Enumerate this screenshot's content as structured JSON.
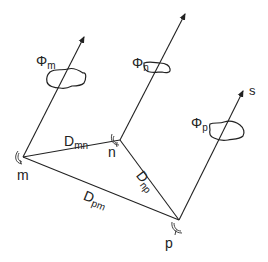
{
  "diagram": {
    "colors": {
      "stroke": "#222222",
      "background": "#ffffff"
    },
    "nodes": [
      {
        "id": "m",
        "label": "m",
        "x": 23,
        "y": 157
      },
      {
        "id": "n",
        "label": "n",
        "x": 120,
        "y": 140
      },
      {
        "id": "p",
        "label": "p",
        "x": 179,
        "y": 220
      }
    ],
    "edges": [
      {
        "from": "m",
        "to": "n",
        "label_main": "D",
        "label_sub": "mn"
      },
      {
        "from": "n",
        "to": "p",
        "label_main": "D",
        "label_sub": "np"
      },
      {
        "from": "p",
        "to": "m",
        "label_main": "D",
        "label_sub": "pm"
      }
    ],
    "rays": [
      {
        "from": "m",
        "cloud_label_main": "Φ",
        "cloud_label_sub": "m"
      },
      {
        "from": "n",
        "cloud_label_main": "Φ",
        "cloud_label_sub": "n"
      },
      {
        "from": "p",
        "cloud_label_main": "Φ",
        "cloud_label_sub": "p",
        "direction_label": "s"
      }
    ],
    "icons": [
      "antenna-dish-icon",
      "cloud-icon",
      "arrow-icon"
    ]
  }
}
